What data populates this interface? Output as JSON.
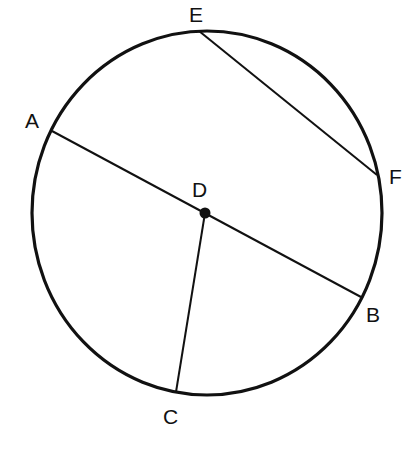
{
  "diagram": {
    "type": "circle-geometry",
    "circle": {
      "cx": 207,
      "cy": 213,
      "rx": 175,
      "ry": 182,
      "stroke": "#111111",
      "stroke_width": 3.2
    },
    "points": {
      "A": {
        "label": "A",
        "x": 52,
        "y": 131,
        "lx": 25,
        "ly": 128
      },
      "B": {
        "label": "B",
        "x": 361,
        "y": 297,
        "lx": 366,
        "ly": 322
      },
      "C": {
        "label": "C",
        "x": 176,
        "y": 392,
        "lx": 163,
        "ly": 424
      },
      "D": {
        "label": "D",
        "x": 205,
        "y": 213,
        "lx": 192,
        "ly": 197
      },
      "E": {
        "label": "E",
        "x": 199,
        "y": 31,
        "lx": 189,
        "ly": 22
      },
      "F": {
        "label": "F",
        "x": 377,
        "y": 175,
        "lx": 389,
        "ly": 184
      }
    },
    "segments": [
      {
        "name": "diameter-AB",
        "from": "A",
        "to": "B"
      },
      {
        "name": "radius-DC",
        "from": "D",
        "to": "C"
      },
      {
        "name": "chord-EF",
        "from": "E",
        "to": "F"
      }
    ],
    "center_point": "D"
  }
}
